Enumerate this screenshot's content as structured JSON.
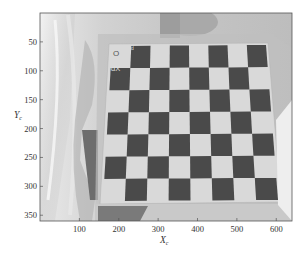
{
  "figure": {
    "kind": "camera calibration image with checkerboard in image-coordinate axes",
    "xlabel": "X",
    "xlabel_sub": "c",
    "ylabel": "Y",
    "ylabel_sub": "c",
    "xlim": [
      0,
      640
    ],
    "ylim": [
      0,
      360
    ],
    "x_ticks": [
      "100",
      "200",
      "300",
      "400",
      "500",
      "600"
    ],
    "y_ticks": [
      "50",
      "100",
      "150",
      "200",
      "250",
      "300",
      "350"
    ],
    "board_labels": {
      "origin": "O",
      "x_direction": "dX",
      "y_direction": "d"
    },
    "checkerboard": {
      "rows": 7,
      "cols": 8
    },
    "colors": {
      "dark_square": "#4a4a4a",
      "light_square": "#d4d4d4",
      "frame": "#555555",
      "background_scene": "#c8c8c8"
    }
  }
}
